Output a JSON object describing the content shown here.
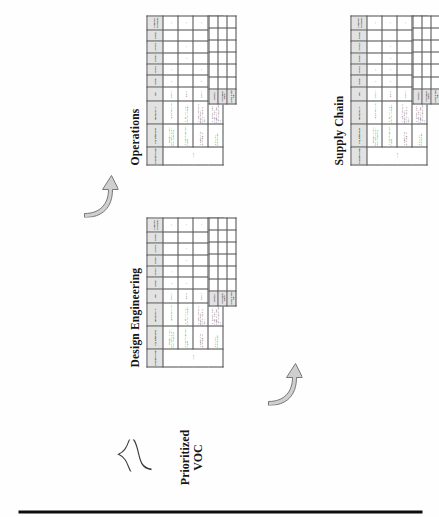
{
  "page": {
    "orientation": "landscape-rotated-90",
    "background": "#fdfdfc",
    "edge_bar_color": "#0d0d0d"
  },
  "source_label": {
    "line1": "Prioritized",
    "line2": "VOC",
    "name": "prioritized-voc"
  },
  "groups": [
    {
      "id": "design-engineering",
      "title": "Design Engineering"
    },
    {
      "id": "operations",
      "title": "Operations"
    },
    {
      "id": "supply-chain",
      "title": "Supply Chain"
    }
  ],
  "matrix": {
    "headers": {
      "stakeholder": "Stakeholder Group",
      "ctq": "CTQ Requirements",
      "spec": "Specification \"Y\"",
      "sign": "Sign",
      "competitor": "Competitor Performance"
    },
    "section_headers": [
      "Section 1",
      "Section 2",
      "Section 3",
      "Section 4",
      "Section 5"
    ],
    "stakeholder_value": "1. Client",
    "ctq_requirements": [
      "1.1. Site search for audio recordings through all of the composite themes",
      "1.2. Customer's assurance for access",
      "1.3. Data workflow handled capability",
      "1.4. Should be referenced/shared"
    ],
    "specifications": [
      "1.1.1 Cause effect 3 clicks",
      "1.2.1 Failure in 10 hour, controlled differentiation",
      "1.3.1 Web content with all available views or workflow job sharing platform",
      "1.4.1 Accessibility and compatibility and repeatability for data driven use-case approved copy"
    ],
    "signs": [
      "Transform",
      "Distinct",
      "Transform",
      "Even"
    ]
  },
  "footer_rows": [
    {
      "label": "Target (s)"
    },
    {
      "label": "Performance Gap (s)"
    },
    {
      "label": "Actions to Close Gap"
    }
  ],
  "tables": [
    {
      "group": "design-engineering",
      "sections": [
        {
          "label": "Section 1",
          "values": [
            "5",
            "3",
            "",
            ""
          ]
        },
        {
          "label": "Section 2",
          "values": [
            "3",
            "",
            "",
            "10"
          ]
        },
        {
          "label": "Section 3",
          "values": [
            "",
            "3",
            "",
            ""
          ]
        },
        {
          "label": "Section 4",
          "values": [
            "",
            "10",
            "",
            ""
          ]
        },
        {
          "label": "Section 5",
          "values": [
            "",
            "",
            "",
            "5"
          ]
        }
      ],
      "competitor": [
        "8",
        "7",
        "6",
        "4"
      ]
    },
    {
      "group": "operations",
      "sections": [
        {
          "label": "Section 1",
          "values": [
            "3",
            "",
            "8",
            ""
          ]
        },
        {
          "label": "Section 2",
          "values": [
            "5",
            "",
            "10",
            ""
          ]
        },
        {
          "label": "Section 3",
          "values": [
            "",
            "5",
            "",
            ""
          ]
        },
        {
          "label": "Section 4",
          "values": [
            "",
            "10",
            "",
            ""
          ]
        },
        {
          "label": "Section 5",
          "values": [
            "",
            "",
            "",
            "5"
          ]
        }
      ],
      "competitor": [
        "8",
        "7",
        "6",
        "4"
      ]
    },
    {
      "group": "supply-chain",
      "sections": [
        {
          "label": "Section 1",
          "values": [
            "5",
            "3",
            "",
            ""
          ]
        },
        {
          "label": "Section 2",
          "values": [
            "3",
            "10",
            "",
            ""
          ]
        },
        {
          "label": "Section 3",
          "values": [
            "",
            "3",
            "",
            ""
          ]
        },
        {
          "label": "Section 4",
          "values": [
            "",
            "10",
            "",
            ""
          ]
        },
        {
          "label": "Section 5",
          "values": [
            "",
            "",
            "",
            "5"
          ]
        }
      ],
      "competitor": [
        "8",
        "7",
        "6",
        "4"
      ]
    }
  ],
  "flow_arrows": [
    {
      "name": "arrow-to-operations",
      "from": "prioritized-voc",
      "to": "operations"
    },
    {
      "name": "arrow-to-supply-chain",
      "from": "design-engineering",
      "to": "supply-chain"
    }
  ]
}
